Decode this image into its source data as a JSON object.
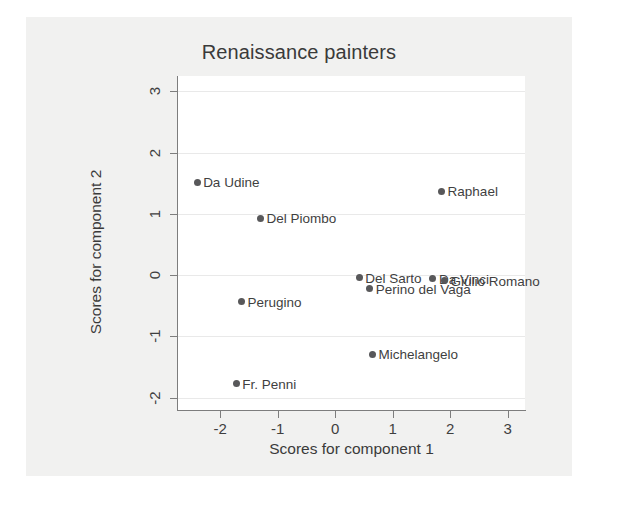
{
  "chart_data": {
    "type": "scatter",
    "title": "Renaissance painters",
    "xlabel": "Scores for component 1",
    "ylabel": "Scores for component 2",
    "xlim": [
      -2.75,
      3.3
    ],
    "ylim": [
      -2.2,
      3.25
    ],
    "xticks": [
      -2,
      -1,
      0,
      1,
      2,
      3
    ],
    "xticklabels": [
      "-2",
      "-1",
      "0",
      "1",
      "2",
      "3"
    ],
    "yticks": [
      -2,
      -1,
      0,
      1,
      2,
      3
    ],
    "yticklabels": [
      "-2",
      "-1",
      "0",
      "1",
      "2",
      "3"
    ],
    "grid": "horizontal-faint",
    "legend": "none",
    "marker_color": "#58585a",
    "points": [
      {
        "label": "Da Udine",
        "x": -2.4,
        "y": 1.52,
        "label_pos": "right"
      },
      {
        "label": "Del Piombo",
        "x": -1.3,
        "y": 0.93,
        "label_pos": "right"
      },
      {
        "label": "Raphael",
        "x": 1.85,
        "y": 1.37,
        "label_pos": "right"
      },
      {
        "label": "Del Sarto",
        "x": 0.42,
        "y": -0.04,
        "label_pos": "right"
      },
      {
        "label": "Perino del Vaga",
        "x": 0.6,
        "y": -0.22,
        "label_pos": "right"
      },
      {
        "label": "Da Vinci",
        "x": 1.7,
        "y": -0.06,
        "label_pos": "right"
      },
      {
        "label": "Giulio Romano",
        "x": 1.9,
        "y": -0.09,
        "label_pos": "right"
      },
      {
        "label": "Perugino",
        "x": -1.63,
        "y": -0.43,
        "label_pos": "right"
      },
      {
        "label": "Michelangelo",
        "x": 0.65,
        "y": -1.29,
        "label_pos": "right"
      },
      {
        "label": "Fr. Penni",
        "x": -1.72,
        "y": -1.77,
        "label_pos": "right"
      }
    ]
  }
}
